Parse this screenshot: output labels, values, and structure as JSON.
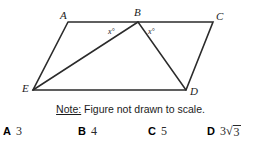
{
  "figure": {
    "type": "geometry-diagram",
    "shape": "quadrilateral-with-diagonals",
    "stroke_color": "#2b2b2b",
    "background_color": "#ffffff",
    "vertices": [
      {
        "id": "A",
        "label": "A",
        "x": 68,
        "y": 22
      },
      {
        "id": "B",
        "label": "B",
        "x": 138,
        "y": 22
      },
      {
        "id": "C",
        "label": "C",
        "x": 213,
        "y": 22
      },
      {
        "id": "D",
        "label": "D",
        "x": 186,
        "y": 90
      },
      {
        "id": "E",
        "label": "E",
        "x": 33,
        "y": 90
      }
    ],
    "edges": [
      {
        "from": "A",
        "to": "B"
      },
      {
        "from": "B",
        "to": "C"
      },
      {
        "from": "C",
        "to": "D"
      },
      {
        "from": "D",
        "to": "E"
      },
      {
        "from": "E",
        "to": "A"
      },
      {
        "from": "E",
        "to": "B"
      },
      {
        "from": "B",
        "to": "D"
      }
    ],
    "angle_labels": [
      {
        "id": "angle-ABE",
        "text": "x°",
        "at_vertex": "B",
        "side": "left"
      },
      {
        "id": "angle-DBC",
        "text": "x°",
        "at_vertex": "B",
        "side": "right"
      }
    ]
  },
  "note": {
    "prefix": "Note:",
    "text": " Figure not drawn to scale."
  },
  "choices": [
    {
      "letter": "A",
      "value": "3",
      "has_radical": false,
      "radicand": ""
    },
    {
      "letter": "B",
      "value": "4",
      "has_radical": false,
      "radicand": ""
    },
    {
      "letter": "C",
      "value": "5",
      "has_radical": false,
      "radicand": ""
    },
    {
      "letter": "D",
      "value": "3",
      "has_radical": true,
      "radicand": "3"
    }
  ]
}
